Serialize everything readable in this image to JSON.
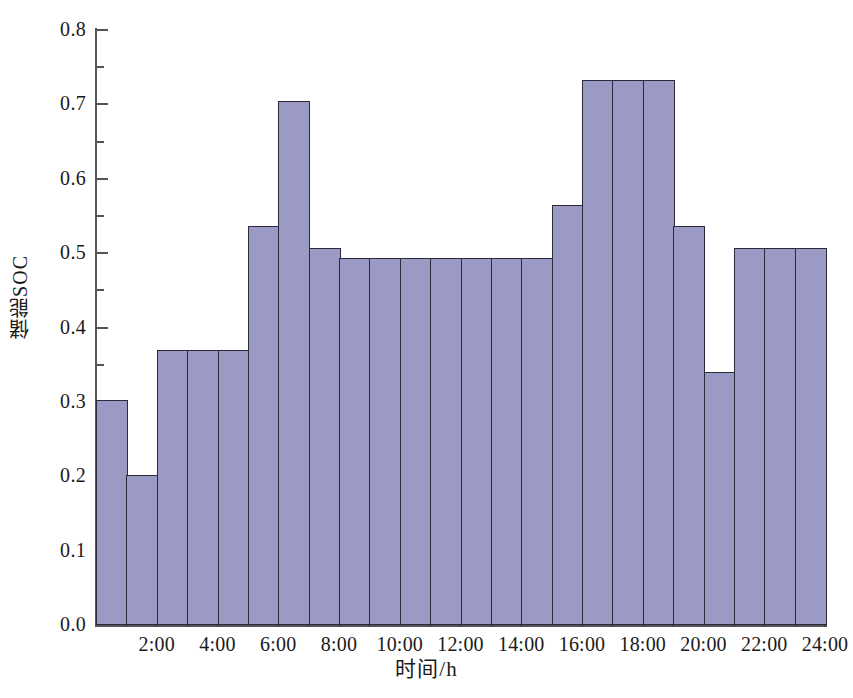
{
  "figure": {
    "title": "",
    "background": "#ffffff",
    "bar_fill": "#9a9ac4",
    "bar_edge": "#2a2a3c",
    "axis_color": "#555555"
  },
  "axes": {
    "ylabel": "储能SOC",
    "xlabel": "时间/h",
    "ytick_labels": [
      "0.0",
      "0.1",
      "0.2",
      "0.3",
      "0.4",
      "0.5",
      "0.6",
      "0.7",
      "0.8"
    ],
    "xtick_labels": [
      "2:00",
      "4:00",
      "6:00",
      "8:00",
      "10:00",
      "12:00",
      "14:00",
      "16:00",
      "18:00",
      "20:00",
      "22:00",
      "24:00"
    ]
  },
  "caption_sliver": "",
  "chart_data": {
    "type": "bar",
    "title": "",
    "xlabel": "时间/h",
    "ylabel": "储能SOC",
    "ylim": [
      0.0,
      0.8
    ],
    "xlim": [
      0,
      24
    ],
    "grid": false,
    "legend": null,
    "y_major_ticks": [
      0.0,
      0.1,
      0.2,
      0.3,
      0.4,
      0.5,
      0.6,
      0.7,
      0.8
    ],
    "y_minor_ticks": [
      0.05,
      0.15,
      0.25,
      0.35,
      0.45,
      0.55,
      0.65,
      0.75
    ],
    "x_major_ticks": [
      2,
      4,
      6,
      8,
      10,
      12,
      14,
      16,
      18,
      20,
      22,
      24
    ],
    "x_minor_ticks": [
      1,
      3,
      5,
      7,
      9,
      11,
      13,
      15,
      17,
      19,
      21,
      23
    ],
    "categories": [
      "1:00",
      "2:00",
      "3:00",
      "4:00",
      "5:00",
      "6:00",
      "7:00",
      "8:00",
      "9:00",
      "10:00",
      "11:00",
      "12:00",
      "13:00",
      "14:00",
      "15:00",
      "16:00",
      "17:00",
      "18:00",
      "19:00",
      "20:00",
      "21:00",
      "22:00",
      "23:00",
      "24:00"
    ],
    "values": [
      0.303,
      0.202,
      0.37,
      0.37,
      0.37,
      0.536,
      0.704,
      0.507,
      0.494,
      0.494,
      0.494,
      0.494,
      0.494,
      0.494,
      0.494,
      0.565,
      0.733,
      0.733,
      0.733,
      0.536,
      0.34,
      0.507,
      0.507,
      0.507
    ]
  }
}
